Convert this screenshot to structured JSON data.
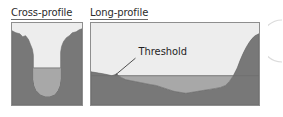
{
  "figure": {
    "width": 283,
    "height": 117,
    "background_color": "#ffffff",
    "panels": [
      {
        "id": "cross",
        "title": "Cross-profile",
        "title_underlined": true
      },
      {
        "id": "long",
        "title": "Long-profile",
        "title_underlined": true,
        "annotations": [
          {
            "label": "Threshold",
            "leader_line": true
          }
        ]
      }
    ]
  },
  "colors": {
    "rock": "#787878",
    "rock_edge": "#5f5f5f",
    "water": "#a8a8a8",
    "water_surface_line": "#6e6e6e",
    "sky": "#ededed",
    "panel_border": "#8e8e8e",
    "text": "#1f1f1f",
    "title_text": "#2b2b2b",
    "leader_line": "#3a3a3a",
    "corner_arc": "#d8d8d8"
  },
  "chart_data": {
    "type": "area",
    "xlabel": "",
    "ylabel": "",
    "panels": [
      {
        "name": "Cross-profile",
        "description": "U-shaped glacial trough cross section; dark rock walls, water filling the rounded valley floor",
        "xlim": [
          0,
          72
        ],
        "ylim": [
          0,
          84
        ],
        "water_level_y": 46,
        "series": [
          {
            "name": "rock-surface",
            "points": [
              [
                0,
                8
              ],
              [
                4,
                10
              ],
              [
                8,
                11
              ],
              [
                11,
                14
              ],
              [
                14,
                13
              ],
              [
                17,
                17
              ],
              [
                19,
                22
              ],
              [
                21,
                27
              ],
              [
                22,
                33
              ],
              [
                22,
                40
              ],
              [
                22,
                50
              ],
              [
                22,
                58
              ],
              [
                23,
                64
              ],
              [
                25,
                69
              ],
              [
                29,
                73
              ],
              [
                34,
                75
              ],
              [
                39,
                75
              ],
              [
                44,
                73
              ],
              [
                47,
                69
              ],
              [
                49,
                64
              ],
              [
                50,
                57
              ],
              [
                50,
                48
              ],
              [
                50,
                38
              ],
              [
                50,
                30
              ],
              [
                51,
                24
              ],
              [
                53,
                19
              ],
              [
                56,
                15
              ],
              [
                59,
                13
              ],
              [
                62,
                10
              ],
              [
                66,
                9
              ],
              [
                69,
                7
              ],
              [
                72,
                6
              ]
            ]
          },
          {
            "name": "water-surface",
            "points": [
              [
                22,
                46
              ],
              [
                50,
                46
              ]
            ]
          }
        ]
      },
      {
        "name": "Long-profile",
        "description": "Longitudinal fjord profile showing a shallow sill (threshold) near the seaward end and deep basin inland",
        "xlim": [
          0,
          170
        ],
        "ylim": [
          0,
          84
        ],
        "water_level_y": 54,
        "series": [
          {
            "name": "sea-floor",
            "points": [
              [
                0,
                50
              ],
              [
                6,
                51
              ],
              [
                12,
                52
              ],
              [
                17,
                53
              ],
              [
                21,
                54
              ],
              [
                24,
                53
              ],
              [
                26,
                52
              ],
              [
                28,
                54
              ],
              [
                31,
                56
              ],
              [
                35,
                58
              ],
              [
                40,
                59
              ],
              [
                45,
                60
              ],
              [
                50,
                61
              ],
              [
                55,
                62
              ],
              [
                60,
                63
              ],
              [
                66,
                64
              ],
              [
                72,
                66
              ],
              [
                78,
                68
              ],
              [
                84,
                70
              ],
              [
                90,
                71
              ],
              [
                96,
                72
              ],
              [
                102,
                71
              ],
              [
                108,
                70
              ],
              [
                114,
                69
              ],
              [
                120,
                68
              ],
              [
                126,
                67
              ],
              [
                131,
                66
              ],
              [
                136,
                64
              ],
              [
                140,
                60
              ],
              [
                144,
                54
              ],
              [
                148,
                46
              ],
              [
                151,
                38
              ],
              [
                154,
                31
              ],
              [
                157,
                25
              ],
              [
                160,
                20
              ],
              [
                163,
                16
              ],
              [
                166,
                13
              ],
              [
                170,
                11
              ]
            ]
          },
          {
            "name": "water-surface",
            "points": [
              [
                0,
                54
              ],
              [
                170,
                54
              ]
            ]
          }
        ],
        "annotations": [
          {
            "text": "Threshold",
            "text_x": 48,
            "text_y": 33,
            "leader_from": [
              45,
              36
            ],
            "leader_to": [
              25,
              53
            ]
          }
        ]
      }
    ]
  }
}
